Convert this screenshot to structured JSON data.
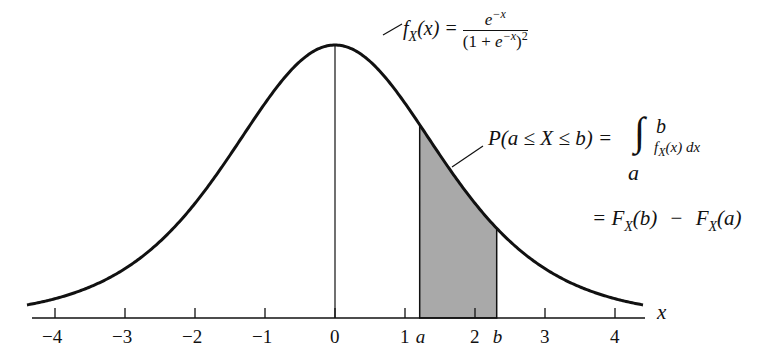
{
  "figure": {
    "type": "logistic probability density diagram",
    "curve_color": "#111111",
    "shade_color": "#a9a9a9",
    "axis": {
      "label": "x",
      "ticks": [
        {
          "value": -4,
          "label": "−4"
        },
        {
          "value": -3,
          "label": "−3"
        },
        {
          "value": -2,
          "label": "−2"
        },
        {
          "value": -1,
          "label": "−1"
        },
        {
          "value": 0,
          "label": "0"
        },
        {
          "value": 1,
          "label": "1"
        },
        {
          "value": 2,
          "label": "2"
        },
        {
          "value": 3,
          "label": "3"
        },
        {
          "value": 4,
          "label": "4"
        }
      ],
      "range": [
        -4.4,
        4.4
      ],
      "markers": [
        {
          "name": "a",
          "value": 1.21,
          "label": "a"
        },
        {
          "name": "b",
          "value": 2.31,
          "label": "b"
        }
      ]
    },
    "density_label": {
      "lhs_f": "f",
      "lhs_sub": "X",
      "lhs_arg": "(x) =",
      "numerator_base": "e",
      "numerator_exp": "−x",
      "denominator_open": "(1 + ",
      "denominator_base": "e",
      "denominator_exp": "−x",
      "denominator_close": ")",
      "denominator_power": "2"
    },
    "probability_label": {
      "lhs": "P(a ≤ X ≤ b) =",
      "integral_sign": "∫",
      "upper_limit": "b",
      "lower_limit": "a",
      "integrand_f": "f",
      "integrand_sub": "X",
      "integrand_rest": "(x) dx"
    },
    "cdf_label": {
      "prefix": "= F",
      "sub1": "X",
      "arg1": "(b)",
      "minus": "−",
      "f2": "F",
      "sub2": "X",
      "arg2": "(a)"
    }
  }
}
